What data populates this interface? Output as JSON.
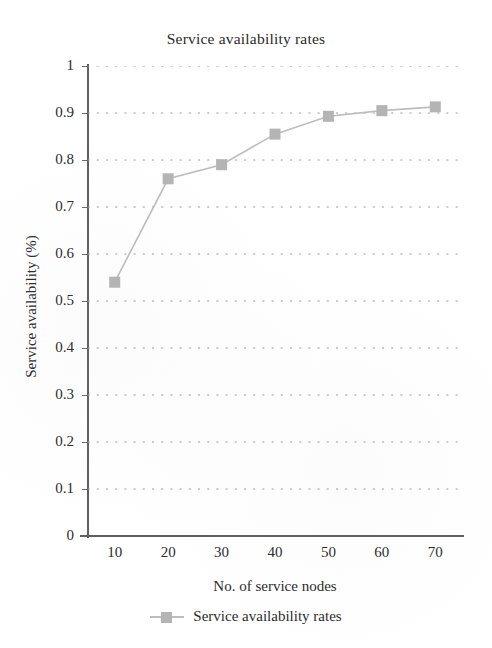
{
  "chart_data": {
    "type": "line",
    "title": "Service availability rates",
    "xlabel": "No. of service nodes",
    "ylabel": "Service availability (%)",
    "x": [
      10,
      20,
      30,
      40,
      50,
      60,
      70
    ],
    "values": [
      0.54,
      0.76,
      0.79,
      0.855,
      0.893,
      0.905,
      0.913
    ],
    "series": [
      {
        "name": "Service availability rates",
        "values": [
          0.54,
          0.76,
          0.79,
          0.855,
          0.893,
          0.905,
          0.913
        ]
      }
    ],
    "x_tick_labels": [
      "10",
      "20",
      "30",
      "40",
      "50",
      "60",
      "70"
    ],
    "y_tick_labels": [
      "0",
      "0.1",
      "0.2",
      "0.3",
      "0.4",
      "0.5",
      "0.6",
      "0.7",
      "0.8",
      "0.9",
      "1"
    ],
    "y_ticks": [
      0,
      0.1,
      0.2,
      0.3,
      0.4,
      0.5,
      0.6,
      0.7,
      0.8,
      0.9,
      1
    ],
    "xlim": [
      5,
      75
    ],
    "ylim": [
      0,
      1
    ],
    "grid": "horizontal-dotted",
    "legend_position": "bottom-center",
    "legend_entries": [
      "Service availability rates"
    ],
    "marker": "square",
    "series_color": "#b4b4b4",
    "line_color": "#bdbdbd",
    "gridline_color": "#9a9a9a",
    "axis_color": "#5f5f5f",
    "text_color": "#2b2b2b"
  }
}
